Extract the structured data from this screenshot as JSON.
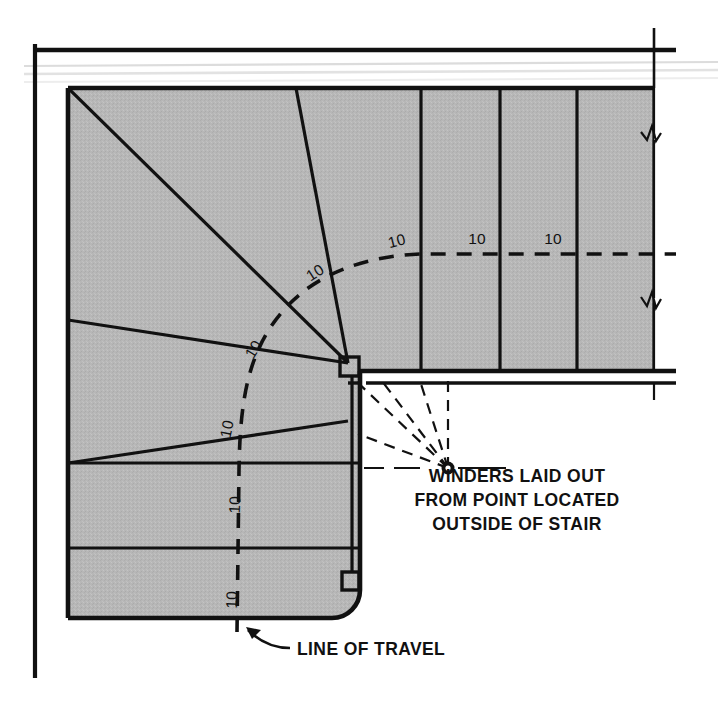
{
  "diagram": {
    "colors": {
      "tread_fill": "#b7b7b7",
      "line": "#111111",
      "wall_line": "#1a1a1a",
      "ghost_line": "#d9d9d9",
      "background": "#ffffff"
    },
    "annotations": {
      "winders_note": {
        "name": "winders-note",
        "lines": [
          "WINDERS LAID OUT",
          "FROM POINT LOCATED",
          "OUTSIDE OF STAIR"
        ]
      },
      "line_of_travel": {
        "name": "line-of-travel-label",
        "text": "LINE OF TRAVEL"
      }
    },
    "dimensions": {
      "label": "10",
      "unit_note": "tread run measured along line of travel",
      "marks": [
        {
          "id": "d1",
          "text": "10",
          "x": 237,
          "y": 600,
          "rotate": -88
        },
        {
          "id": "d2",
          "text": "10",
          "x": 240,
          "y": 505,
          "rotate": -88
        },
        {
          "id": "d3",
          "text": "10",
          "x": 232,
          "y": 430,
          "rotate": -78
        },
        {
          "id": "d4",
          "text": "10",
          "x": 258,
          "y": 352,
          "rotate": -58
        },
        {
          "id": "d5",
          "text": "10",
          "x": 318,
          "y": 277,
          "rotate": -33
        },
        {
          "id": "d6",
          "text": "10",
          "x": 398,
          "y": 246,
          "rotate": -14
        },
        {
          "id": "d7",
          "text": "10",
          "x": 477,
          "y": 244,
          "rotate": 0
        },
        {
          "id": "d8",
          "text": "10",
          "x": 553,
          "y": 244,
          "rotate": 0
        }
      ]
    },
    "geometry": {
      "radius_point": {
        "x": 448,
        "y": 468,
        "label": "layout point"
      },
      "tread_count_visible": 12,
      "stair_edge_left_x": 68,
      "wall_left_x": 35,
      "wall_top_y": 50,
      "stair_top_y": 88
    }
  }
}
